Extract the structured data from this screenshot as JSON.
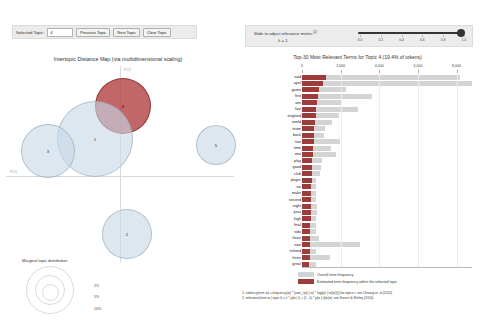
{
  "left_panel": {
    "controls": {
      "selected_topic_label": "Selected Topic:",
      "selected_topic_value": "4",
      "previous_topic_label": "Previous Topic",
      "next_topic_label": "Next Topic",
      "clear_topic_label": "Clear Topic"
    },
    "title": "Intertopic Distance Map (via multidimensional scaling)",
    "axis_labels": {
      "x": "PC1",
      "y": "PC2"
    },
    "marginal": {
      "title": "Marginal topic distribution",
      "ticks": [
        "2%",
        "5%",
        "10%"
      ]
    }
  },
  "right_panel": {
    "slider": {
      "label": "Slide to adjust relevance metric:",
      "label_sup": "(2)",
      "lambda_label": "λ = 1",
      "value": 1,
      "ticks": [
        "0.0",
        "0.2",
        "0.4",
        "0.6",
        "0.8",
        "1.0"
      ]
    },
    "title": "Top-30 Most Relevant Terms for Topic 4 (19.4% of tokens)",
    "legend": {
      "overall_label": "Overall term frequency",
      "topic_label": "Estimated term frequency within the selected topic",
      "overall_color": "#d4d4d4",
      "topic_color": "#9e3b3b"
    },
    "footnotes": [
      "1. saliency(term w) = frequency(w) * [sum_t p(t | w) * log(p(t | w)/p(t))] for topics t; see Chuang et. al (2012)",
      "2. relevance(term w | topic t) = λ * p(w | t) + (1 - λ) * p(w | t)/p(w); see Sievert & Shirley (2014)"
    ]
  },
  "chart_data": [
    {
      "type": "scatter",
      "title": "Intertopic Distance Map (via multidimensional scaling)",
      "xlabel": "PC1",
      "ylabel": "PC2",
      "grid": true,
      "selected": 4,
      "points": [
        {
          "topic": "4",
          "cx": 116,
          "cy": 39,
          "r": 27,
          "selected": true
        },
        {
          "topic": "1",
          "cx": 88,
          "cy": 72,
          "r": 37,
          "selected": false
        },
        {
          "topic": "3",
          "cx": 41,
          "cy": 84,
          "r": 26,
          "selected": false
        },
        {
          "topic": "5",
          "cx": 209,
          "cy": 78,
          "r": 19,
          "selected": false
        },
        {
          "topic": "2",
          "cx": 120,
          "cy": 167,
          "r": 24,
          "selected": false
        }
      ]
    },
    {
      "type": "bar",
      "orientation": "horizontal",
      "title": "Top-30 Most Relevant Terms for Topic 4 (19.4% of tokens)",
      "xlabel": "",
      "ylabel": "",
      "xlim": [
        0,
        8800
      ],
      "xticks": [
        0,
        2000,
        4000,
        6000,
        8000
      ],
      "xtick_labels": [
        "0",
        "2,000",
        "4,000",
        "6,000",
        "8,000"
      ],
      "categories": [
        "said",
        "april",
        "game",
        "first",
        "win",
        "last",
        "england",
        "world",
        "team",
        "back",
        "two",
        "time",
        "one",
        "play",
        "good",
        "club",
        "player",
        "six",
        "make",
        "second",
        "night",
        "year",
        "high",
        "final",
        "side",
        "three",
        "now",
        "ireland",
        "three",
        "great"
      ],
      "series": [
        {
          "name": "Overall term frequency",
          "values": [
            8200,
            8800,
            2300,
            3600,
            2050,
            2900,
            1900,
            1550,
            1200,
            1150,
            1950,
            1500,
            1750,
            1050,
            1000,
            950,
            700,
            720,
            700,
            700,
            760,
            760,
            740,
            700,
            700,
            900,
            3000,
            700,
            1450,
            700
          ]
        },
        {
          "name": "Estimated term frequency within the selected topic",
          "values": [
            1250,
            1100,
            900,
            820,
            800,
            720,
            700,
            660,
            640,
            620,
            600,
            590,
            560,
            540,
            520,
            505,
            495,
            480,
            470,
            460,
            450,
            445,
            440,
            430,
            420,
            415,
            410,
            400,
            395,
            385
          ]
        }
      ],
      "legend_position": "bottom"
    }
  ]
}
